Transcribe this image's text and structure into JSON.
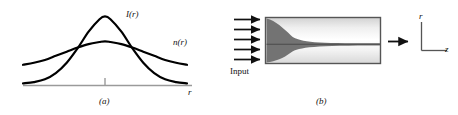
{
  "figure": {
    "panels": [
      {
        "id": "a",
        "caption": "(a)",
        "curve_labels": {
          "intensity": "I(r)",
          "index": "n(r)"
        },
        "axis_label": "r"
      },
      {
        "id": "b",
        "caption": "(b)",
        "input_label": "Input",
        "axes": {
          "vertical": "r",
          "horizontal": "z"
        }
      }
    ]
  },
  "chart_data": {
    "type": "line",
    "title": "",
    "xlabel": "r",
    "ylabel": "",
    "grid": false,
    "legend": "inline-labels",
    "xlim": [
      -3,
      3
    ],
    "ylim": [
      0,
      1.05
    ],
    "x": [
      -3,
      -2.6,
      -2.2,
      -1.8,
      -1.4,
      -1,
      -0.6,
      -0.2,
      0,
      0.2,
      0.6,
      1,
      1.4,
      1.8,
      2.2,
      2.6,
      3
    ],
    "series": [
      {
        "name": "I(r)",
        "label": "I(r)",
        "color": "#000000",
        "values": [
          0.03,
          0.05,
          0.09,
          0.18,
          0.33,
          0.54,
          0.78,
          0.96,
          1.0,
          0.96,
          0.78,
          0.54,
          0.33,
          0.18,
          0.09,
          0.05,
          0.03
        ]
      },
      {
        "name": "n(r)",
        "label": "n(r)",
        "color": "#000000",
        "values": [
          0.3,
          0.33,
          0.37,
          0.43,
          0.49,
          0.55,
          0.6,
          0.63,
          0.64,
          0.63,
          0.6,
          0.55,
          0.49,
          0.43,
          0.37,
          0.33,
          0.3
        ]
      }
    ],
    "tick_marks": [
      {
        "x": 0,
        "label": ""
      }
    ],
    "axis_color": "#9a9a9a",
    "curve_width": 2.2
  },
  "colors": {
    "curve": "#000000",
    "axis": "#9a9a9a",
    "arrow": "#111111",
    "medium_border": "#555555",
    "beam_dark": "#6f6f6f",
    "medium_light": "#ffffff",
    "medium_gray": "#cfcfcf"
  }
}
